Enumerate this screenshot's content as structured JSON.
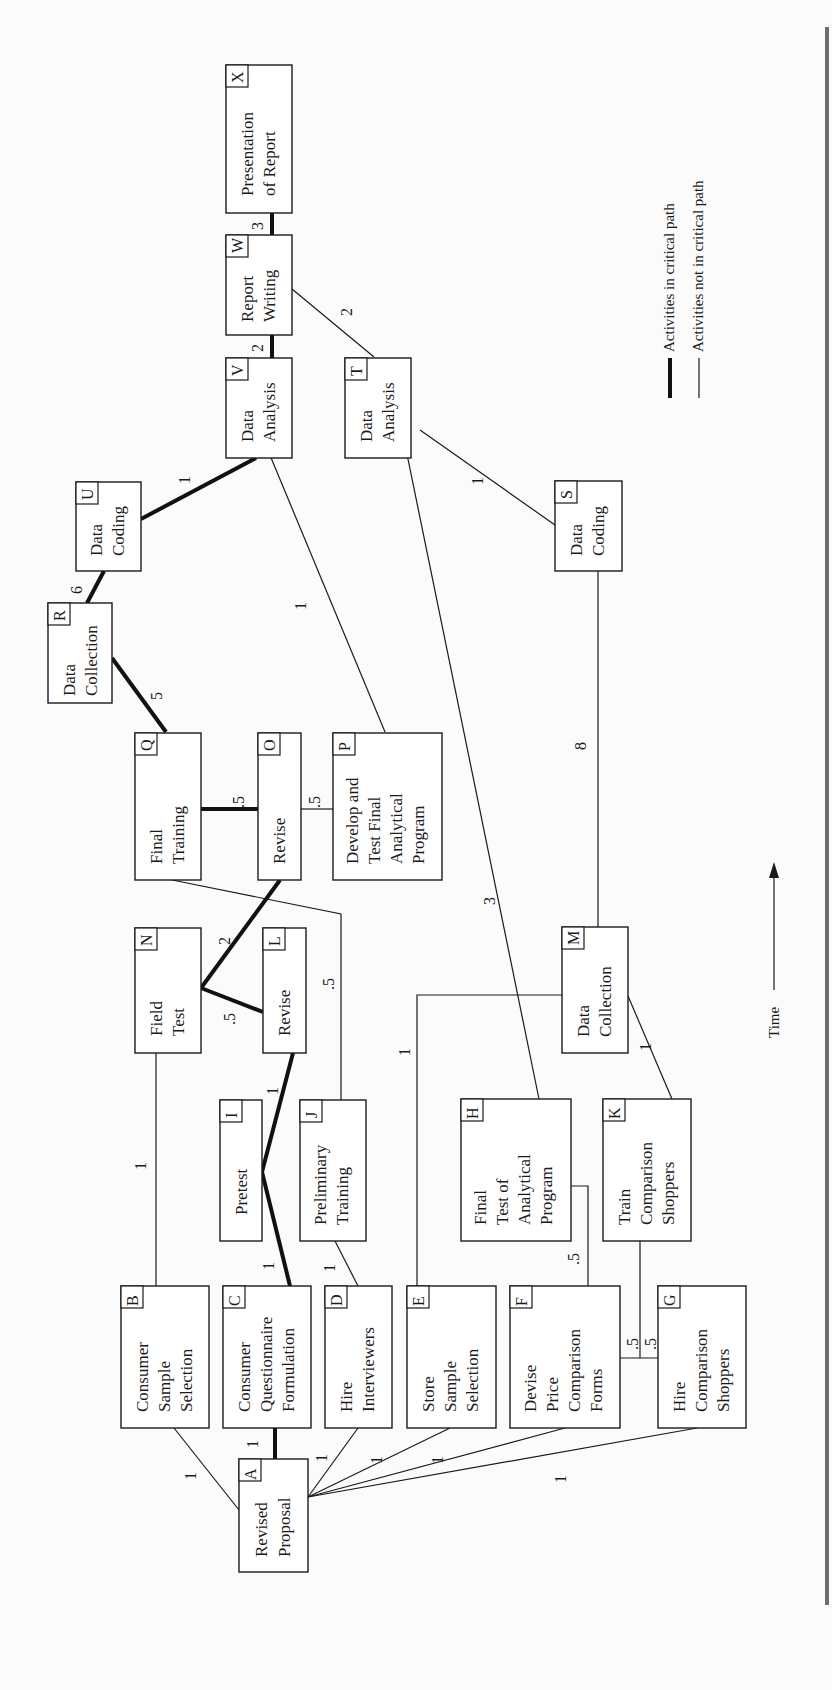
{
  "figure": {
    "orientation": "rotated-90-ccw",
    "time_axis_label": "Time",
    "legend": [
      {
        "style": "thick",
        "label": "Activities in critical path"
      },
      {
        "style": "thin",
        "label": "Activities not in critical path"
      }
    ]
  },
  "nodes": {
    "A": {
      "id": "A",
      "lines": [
        "Revised",
        "Proposal"
      ]
    },
    "B": {
      "id": "B",
      "lines": [
        "Consumer",
        "Sample",
        "Selection"
      ]
    },
    "C": {
      "id": "C",
      "lines": [
        "Consumer",
        "Questionnaire",
        "Formulation"
      ]
    },
    "D": {
      "id": "D",
      "lines": [
        "Hire",
        "Interviewers"
      ]
    },
    "E": {
      "id": "E",
      "lines": [
        "Store",
        "Sample",
        "Selection"
      ]
    },
    "F": {
      "id": "F",
      "lines": [
        "Devise",
        "Price",
        "Comparison",
        "Forms"
      ]
    },
    "G": {
      "id": "G",
      "lines": [
        "Hire",
        "Comparison",
        "Shoppers"
      ]
    },
    "H": {
      "id": "H",
      "lines": [
        "Final",
        "Test of",
        "Analytical",
        "Program"
      ]
    },
    "I": {
      "id": "I",
      "lines": [
        "Pretest"
      ]
    },
    "J": {
      "id": "J",
      "lines": [
        "Preliminary",
        "Training"
      ]
    },
    "K": {
      "id": "K",
      "lines": [
        "Train",
        "Comparison",
        "Shoppers"
      ]
    },
    "L": {
      "id": "L",
      "lines": [
        "Revise"
      ]
    },
    "M": {
      "id": "M",
      "lines": [
        "Data",
        "Collection"
      ]
    },
    "N": {
      "id": "N",
      "lines": [
        "Field",
        "Test"
      ]
    },
    "O": {
      "id": "O",
      "lines": [
        "Revise"
      ]
    },
    "P": {
      "id": "P",
      "lines": [
        "Develop and",
        "Test Final",
        "Analytical",
        "Program"
      ]
    },
    "Q": {
      "id": "Q",
      "lines": [
        "Final",
        "Training"
      ]
    },
    "R": {
      "id": "R",
      "lines": [
        "Data",
        "Collection"
      ]
    },
    "S": {
      "id": "S",
      "lines": [
        "Data",
        "Coding"
      ]
    },
    "T": {
      "id": "T",
      "lines": [
        "Data",
        "Analysis"
      ]
    },
    "U": {
      "id": "U",
      "lines": [
        "Data",
        "Coding"
      ]
    },
    "V": {
      "id": "V",
      "lines": [
        "Data",
        "Analysis"
      ]
    },
    "W": {
      "id": "W",
      "lines": [
        "Report",
        "Writing"
      ]
    },
    "X": {
      "id": "X",
      "lines": [
        "Presentation",
        "of Report"
      ]
    }
  },
  "edges": [
    {
      "from": "A",
      "to": "B",
      "duration": "1",
      "critical": false
    },
    {
      "from": "A",
      "to": "C",
      "duration": "1",
      "critical": true
    },
    {
      "from": "A",
      "to": "D",
      "duration": "1",
      "critical": false
    },
    {
      "from": "A",
      "to": "E",
      "duration": "1",
      "critical": false
    },
    {
      "from": "A",
      "to": "F",
      "duration": "1",
      "critical": false
    },
    {
      "from": "A",
      "to": "G",
      "duration": "1",
      "critical": false
    },
    {
      "from": "B",
      "to": "N",
      "duration": "1",
      "critical": false
    },
    {
      "from": "C",
      "to": "I",
      "duration": "1",
      "critical": true
    },
    {
      "from": "D",
      "to": "J",
      "duration": "1",
      "critical": false
    },
    {
      "from": "E",
      "to": "M",
      "duration": "1",
      "critical": false
    },
    {
      "from": "F",
      "to": "H",
      "duration": ".5",
      "critical": false
    },
    {
      "from": "F",
      "to": "K",
      "duration": ".5",
      "critical": false
    },
    {
      "from": "G",
      "to": "K",
      "duration": ".5",
      "critical": false
    },
    {
      "from": "I",
      "to": "L",
      "duration": "1",
      "critical": true
    },
    {
      "from": "L",
      "to": "N",
      "duration": ".5",
      "critical": true
    },
    {
      "from": "N",
      "to": "O",
      "duration": "2",
      "critical": true
    },
    {
      "from": "J",
      "to": "Q",
      "duration": ".5",
      "critical": false
    },
    {
      "from": "O",
      "to": "Q",
      "duration": ".5",
      "critical": true
    },
    {
      "from": "O",
      "to": "P",
      "duration": ".5",
      "critical": false
    },
    {
      "from": "Q",
      "to": "R",
      "duration": "5",
      "critical": true
    },
    {
      "from": "R",
      "to": "U",
      "duration": "6",
      "critical": true
    },
    {
      "from": "U",
      "to": "V",
      "duration": "1",
      "critical": true
    },
    {
      "from": "P",
      "to": "V",
      "duration": "1",
      "critical": false
    },
    {
      "from": "H",
      "to": "T",
      "duration": "3",
      "critical": false
    },
    {
      "from": "K",
      "to": "M",
      "duration": "1",
      "critical": false
    },
    {
      "from": "M",
      "to": "S",
      "duration": "8",
      "critical": false
    },
    {
      "from": "S",
      "to": "T",
      "duration": "1",
      "critical": false
    },
    {
      "from": "V",
      "to": "W",
      "duration": "2",
      "critical": true
    },
    {
      "from": "T",
      "to": "W",
      "duration": "2",
      "critical": false
    },
    {
      "from": "W",
      "to": "X",
      "duration": "3",
      "critical": true
    }
  ]
}
